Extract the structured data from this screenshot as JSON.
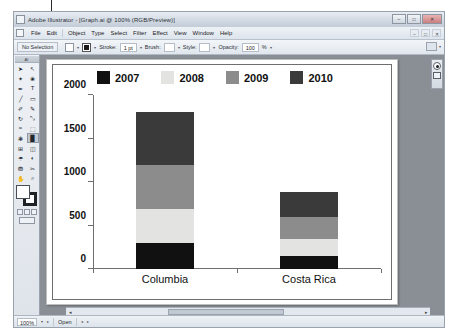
{
  "window": {
    "title": "Adobe Illustrator - [Graph.ai @ 100% (RGB/Preview)]",
    "app_icon": "illustrator-icon",
    "controls": {
      "minimize": "–",
      "maximize": "□",
      "close": "✕"
    }
  },
  "menubar": {
    "items": [
      "File",
      "Edit",
      "Object",
      "Type",
      "Select",
      "Filter",
      "Effect",
      "View",
      "Window",
      "Help"
    ],
    "right_controls": [
      "–",
      "□",
      "✕"
    ]
  },
  "controlbar": {
    "selection_status": "No Selection",
    "fill_label": "Fill",
    "stroke_label": "Stroke:",
    "stroke_weight": "1 pt",
    "brush_label": "Brush:",
    "style_label": "Style:",
    "opacity_label": "Opacity:",
    "opacity_value": "100",
    "opacity_unit": "%",
    "dropdown_caret": "▾"
  },
  "toolbox": {
    "header": "AI",
    "tools": [
      {
        "name": "selection-tool",
        "glyph": "➤"
      },
      {
        "name": "direct-selection-tool",
        "glyph": "↖"
      },
      {
        "name": "magic-wand-tool",
        "glyph": "✦"
      },
      {
        "name": "lasso-tool",
        "glyph": "❀"
      },
      {
        "name": "pen-tool",
        "glyph": "✒"
      },
      {
        "name": "type-tool",
        "glyph": "T"
      },
      {
        "name": "line-segment-tool",
        "glyph": "╱"
      },
      {
        "name": "rectangle-tool",
        "glyph": "▭"
      },
      {
        "name": "paintbrush-tool",
        "glyph": "✐"
      },
      {
        "name": "pencil-tool",
        "glyph": "✎"
      },
      {
        "name": "rotate-tool",
        "glyph": "↻"
      },
      {
        "name": "scale-tool",
        "glyph": "⤡"
      },
      {
        "name": "warp-tool",
        "glyph": "≈"
      },
      {
        "name": "free-transform-tool",
        "glyph": "⬚"
      },
      {
        "name": "symbol-sprayer-tool",
        "glyph": "❃"
      },
      {
        "name": "graph-tool",
        "glyph": "█"
      },
      {
        "name": "mesh-tool",
        "glyph": "⊞"
      },
      {
        "name": "gradient-tool",
        "glyph": "◫"
      },
      {
        "name": "eyedropper-tool",
        "glyph": "☂"
      },
      {
        "name": "blend-tool",
        "glyph": "◐"
      },
      {
        "name": "live-paint-bucket-tool",
        "glyph": "⛃"
      },
      {
        "name": "slice-tool",
        "glyph": "✂"
      },
      {
        "name": "hand-tool",
        "glyph": "✋"
      },
      {
        "name": "zoom-tool",
        "glyph": "⌕"
      }
    ],
    "active_tool": "graph-tool",
    "fill_swatch_color": "#ffffff",
    "stroke_swatch_color": "#1e2227"
  },
  "right_dock": {
    "panels": [
      "color-panel-icon",
      "swatches-panel-icon"
    ]
  },
  "statusbar": {
    "zoom": "100%",
    "zoom_caret": "▾",
    "unit_caret": "▸",
    "doc_status": "Open",
    "nav_prev": "◂",
    "nav_next": "▸"
  },
  "chart_data": {
    "type": "bar",
    "subtype": "stacked-column",
    "title": "",
    "xlabel": "",
    "ylabel": "",
    "categories": [
      "Columbia",
      "Costa Rica"
    ],
    "ylim": [
      0,
      2000
    ],
    "yticks": [
      0,
      500,
      1000,
      1500,
      2000
    ],
    "ytick_labels": [
      "0",
      "500",
      "1000",
      "1500",
      "2000"
    ],
    "grid": false,
    "legend_position": "top",
    "series": [
      {
        "name": "2007",
        "color": "#111111",
        "values": [
          300,
          150
        ]
      },
      {
        "name": "2008",
        "color": "#e3e3e1",
        "values": [
          390,
          190
        ]
      },
      {
        "name": "2009",
        "color": "#8c8c8c",
        "values": [
          510,
          260
        ]
      },
      {
        "name": "2010",
        "color": "#3a3a3a",
        "values": [
          600,
          290
        ]
      }
    ],
    "totals": [
      1800,
      890
    ]
  }
}
